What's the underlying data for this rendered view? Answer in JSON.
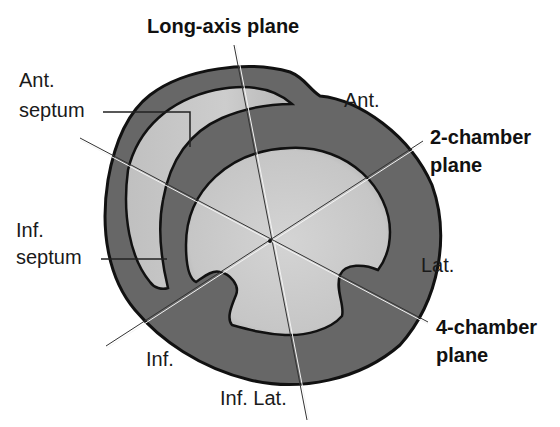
{
  "figure": {
    "type": "cardiac short-axis cross-section with imaging planes",
    "colors": {
      "background": "#ffffff",
      "myocardium": "#676767",
      "cavity": "#c9c9c9",
      "outline": "#111111",
      "plane_line": "#333333"
    }
  },
  "planes": {
    "long_axis": "Long-axis plane",
    "two_chamber_line1": "2-chamber",
    "two_chamber_line2": "plane",
    "four_chamber_line1": "4-chamber",
    "four_chamber_line2": "plane"
  },
  "segments": {
    "ant_septum_line1": "Ant.",
    "ant_septum_line2": "septum",
    "ant": "Ant.",
    "inf_septum_line1": "Inf.",
    "inf_septum_line2": "septum",
    "lat": "Lat.",
    "inf": "Inf.",
    "inf_lat": "Inf. Lat."
  }
}
